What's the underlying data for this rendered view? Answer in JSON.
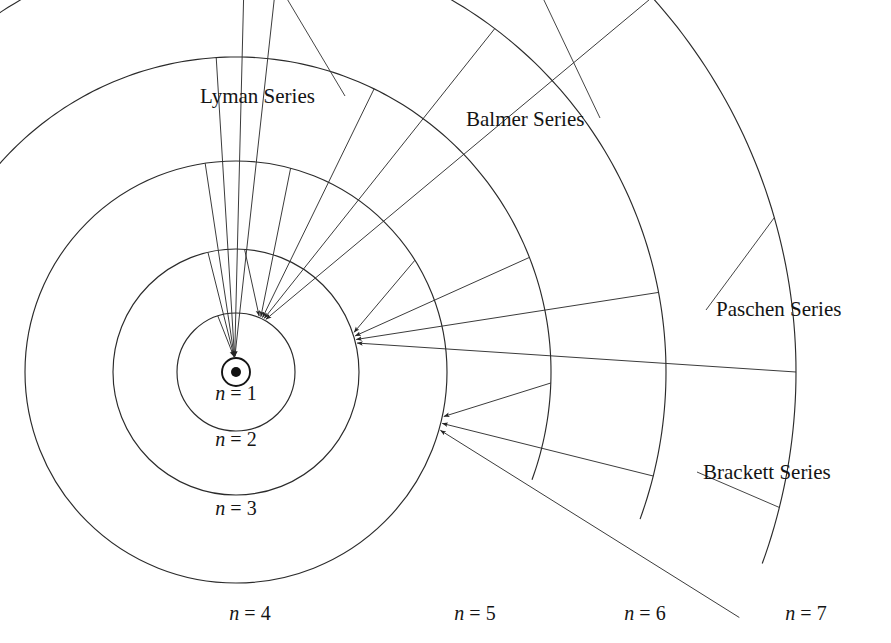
{
  "figure": {
    "background_color": "#ffffff",
    "line_color": "#2b2b2b",
    "text_color": "#141414",
    "width": 891,
    "height": 643
  },
  "center": {
    "x": 236,
    "y": 372
  },
  "nucleus": {
    "name": "nucleus",
    "dot_radius": 5,
    "ring_radius": 14
  },
  "orbits": [
    {
      "n": 1,
      "label": "n = 1",
      "n_symbol": "n",
      "equals": "=",
      "value": "1",
      "radius": 14,
      "label_x": 236,
      "label_y": 400,
      "complete_circle": true
    },
    {
      "n": 2,
      "label": "n = 2",
      "n_symbol": "n",
      "equals": "=",
      "value": "2",
      "radius": 59,
      "label_x": 236,
      "label_y": 446,
      "complete_circle": true
    },
    {
      "n": 3,
      "label": "n = 3",
      "n_symbol": "n",
      "equals": "=",
      "value": "3",
      "radius": 123,
      "label_x": 236,
      "label_y": 515,
      "complete_circle": true
    },
    {
      "n": 4,
      "label": "n = 4",
      "n_symbol": "n",
      "equals": "=",
      "value": "4",
      "radius": 211,
      "label_x": 250,
      "label_y": 620,
      "complete_circle": true
    },
    {
      "n": 5,
      "label": "n = 5",
      "n_symbol": "n",
      "equals": "=",
      "value": "5",
      "radius": 315,
      "label_x": 475,
      "label_y": 620,
      "complete_circle": false
    },
    {
      "n": 6,
      "label": "n = 6",
      "n_symbol": "n",
      "equals": "=",
      "value": "6",
      "radius": 430,
      "label_x": 645,
      "label_y": 620,
      "complete_circle": false
    },
    {
      "n": 7,
      "label": "n = 7",
      "n_symbol": "n",
      "equals": "=",
      "value": "7",
      "radius": 560,
      "label_x": 806,
      "label_y": 620,
      "complete_circle": false
    }
  ],
  "series": [
    {
      "key": "lyman",
      "label": "Lyman Series",
      "label_x": 200,
      "label_y": 103,
      "target_n": 1,
      "description": "transitions down to n = 1"
    },
    {
      "key": "balmer",
      "label": "Balmer Series",
      "label_x": 466,
      "label_y": 126,
      "target_n": 2,
      "description": "transitions down to n = 2"
    },
    {
      "key": "paschen",
      "label": "Paschen Series",
      "label_x": 716,
      "label_y": 316,
      "target_n": 3,
      "description": "transitions down to n = 3"
    },
    {
      "key": "brackett",
      "label": "Brackett Series",
      "label_x": 703,
      "label_y": 479,
      "target_n": 4,
      "description": "transitions down to n = 4"
    }
  ],
  "transitions": {
    "lyman": [
      {
        "from": 2,
        "to": 1
      },
      {
        "from": 3,
        "to": 1
      },
      {
        "from": 4,
        "to": 1
      },
      {
        "from": 5,
        "to": 1
      },
      {
        "from": 6,
        "to": 1
      },
      {
        "from": 7,
        "to": 1
      }
    ],
    "balmer": [
      {
        "from": 3,
        "to": 2
      },
      {
        "from": 4,
        "to": 2
      },
      {
        "from": 5,
        "to": 2
      },
      {
        "from": 6,
        "to": 2
      },
      {
        "from": 7,
        "to": 2
      }
    ],
    "paschen": [
      {
        "from": 4,
        "to": 3
      },
      {
        "from": 5,
        "to": 3
      },
      {
        "from": 6,
        "to": 3
      },
      {
        "from": 7,
        "to": 3
      }
    ],
    "brackett": [
      {
        "from": 5,
        "to": 4
      },
      {
        "from": 6,
        "to": 4
      },
      {
        "from": 7,
        "to": 4
      }
    ]
  }
}
